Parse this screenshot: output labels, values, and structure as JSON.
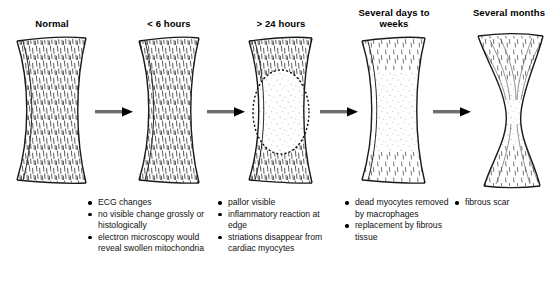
{
  "figure": {
    "kind": "medical-progression-diagram",
    "background_color": "#ffffff",
    "arrow_shaft_color": "#6e6e6e",
    "arrow_head_color": "#000000",
    "tissue_outline_color": "#1a1a1a",
    "tissue_fill_color": "#ffffff",
    "striation_color": "#3a3a3a",
    "stipple_color": "#b0a8a0"
  },
  "stages": [
    {
      "id": "normal",
      "heading": "Normal",
      "heading_lines": [
        "Normal"
      ],
      "bullets": [],
      "tissue": "normal-striated"
    },
    {
      "id": "lt-6-hours",
      "heading": "< 6 hours",
      "heading_lines": [
        "< 6 hours"
      ],
      "bullets": [
        "ECG changes",
        "no visible change grossly or histologically",
        "electron microscopy would reveal swollen mitochondria"
      ],
      "tissue": "normal-striated"
    },
    {
      "id": "gt-24-hours",
      "heading": "> 24 hours",
      "heading_lines": [
        "> 24 hours"
      ],
      "bullets": [
        "pallor visible",
        "inflammatory reaction at edge",
        "striations disappear from cardiac myocytes"
      ],
      "tissue": "pale-infarct-dotted-border"
    },
    {
      "id": "several-days-to-weeks",
      "heading": "Several days to weeks",
      "heading_lines": [
        "Several days",
        "to weeks"
      ],
      "bullets": [
        "dead myocytes removed by macrophages",
        "replacement by fibrous tissue"
      ],
      "tissue": "edge-striations-stippled-centre"
    },
    {
      "id": "several-months",
      "heading": "Several months",
      "heading_lines": [
        "Several",
        "months"
      ],
      "bullets": [
        "fibrous scar"
      ],
      "tissue": "hourglass-fibrous-scar"
    }
  ],
  "arrows": [
    {
      "from": "normal",
      "to": "lt-6-hours"
    },
    {
      "from": "lt-6-hours",
      "to": "gt-24-hours"
    },
    {
      "from": "gt-24-hours",
      "to": "several-days-to-weeks"
    },
    {
      "from": "several-days-to-weeks",
      "to": "several-months"
    }
  ]
}
